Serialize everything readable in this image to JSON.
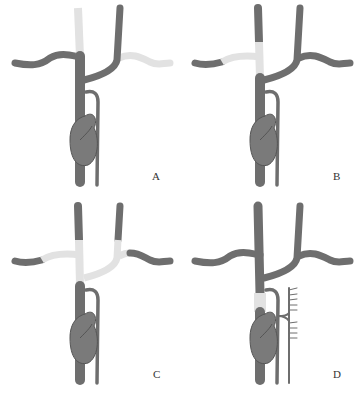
{
  "figure": {
    "colors": {
      "vessel_dark": "#6e6e6e",
      "vessel_light": "#e2e2e2",
      "organ": "#7a7a7a",
      "organ_stroke": "#555555",
      "thin_vessel": "#6e6e6e"
    },
    "panels": [
      {
        "id": "A",
        "label": "A",
        "light_segments": [
          "upper-left-vertical",
          "right-branch"
        ]
      },
      {
        "id": "B",
        "label": "B",
        "light_segments": [
          "left-upper-trunk",
          "left-branch-proximal"
        ]
      },
      {
        "id": "C",
        "label": "C",
        "light_segments": [
          "left-upper-trunk",
          "left-branch-proximal",
          "right-trunk-proximal",
          "right-branch-proximal",
          "junction"
        ]
      },
      {
        "id": "D",
        "label": "D",
        "light_segments": [
          "lower-trunk-segment"
        ],
        "extra": "collateral branches"
      }
    ]
  }
}
